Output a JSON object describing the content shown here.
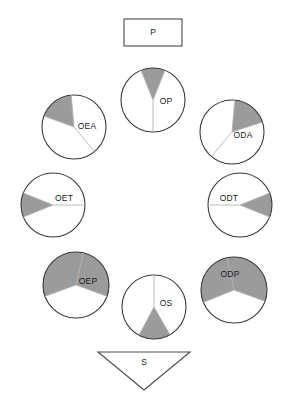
{
  "diagram": {
    "type": "ring-flow-diagram",
    "canvas": {
      "width": 287,
      "height": 406,
      "background": "#ffffff"
    },
    "colors": {
      "sector_fill": "#9b9b9b",
      "outline": "#3a3a3a",
      "divider": "#b4b4b4",
      "text": "#1a1a1a",
      "background": "#ffffff"
    },
    "top_node": {
      "label": "P",
      "shape": "rectangle",
      "x": 124,
      "y": 19,
      "width": 58,
      "height": 27
    },
    "bottom_node": {
      "label": "S",
      "shape": "triangle-down",
      "x": 98,
      "y": 352,
      "width": 92,
      "height": 38,
      "label_x": 144,
      "label_y": 363
    },
    "circles": [
      {
        "label": "OP",
        "cx": 153,
        "cy": 100,
        "r": 32,
        "fill_direction": "up",
        "fill_start_deg": 248,
        "fill_end_deg": 292,
        "divider_angles": [
          248,
          292,
          90
        ],
        "label_dx": 13,
        "label_dy": 2
      },
      {
        "label": "OEA",
        "cx": 74,
        "cy": 127,
        "r": 32,
        "fill_direction": "up-left",
        "fill_start_deg": 200,
        "fill_end_deg": 265,
        "divider_angles": [
          200,
          265,
          50
        ],
        "label_dx": 13,
        "label_dy": 0
      },
      {
        "label": "ODA",
        "cx": 232,
        "cy": 132,
        "r": 32,
        "fill_direction": "up-right",
        "fill_start_deg": 275,
        "fill_end_deg": 342,
        "divider_angles": [
          275,
          342,
          130
        ],
        "label_dx": 11,
        "label_dy": 4
      },
      {
        "label": "OET",
        "cx": 53,
        "cy": 205,
        "r": 32,
        "fill_direction": "left",
        "fill_start_deg": 158,
        "fill_end_deg": 202,
        "divider_angles": [
          158,
          202,
          0
        ],
        "label_dx": 11,
        "label_dy": -6
      },
      {
        "label": "ODT",
        "cx": 240,
        "cy": 205,
        "r": 32,
        "fill_direction": "right",
        "fill_start_deg": 338,
        "fill_end_deg": 22,
        "divider_angles": [
          338,
          22,
          180
        ],
        "label_dx": -11,
        "label_dy": -6
      },
      {
        "label": "OEP",
        "cx": 76,
        "cy": 285,
        "r": 33,
        "fill_direction": "down-left",
        "fill_start_deg": 160,
        "fill_end_deg": 20,
        "divider_angles": [
          160,
          20,
          283
        ],
        "label_dx": 12,
        "label_dy": -3
      },
      {
        "label": "OS",
        "cx": 154,
        "cy": 307,
        "r": 32,
        "fill_direction": "down",
        "fill_start_deg": 60,
        "fill_end_deg": 118,
        "divider_angles": [
          60,
          118,
          270
        ],
        "label_dx": 12,
        "label_dy": -3
      },
      {
        "label": "ODP",
        "cx": 234,
        "cy": 290,
        "r": 33,
        "fill_direction": "down-right",
        "fill_start_deg": 158,
        "fill_end_deg": 20,
        "divider_angles": [
          158,
          20,
          258
        ],
        "label_dx": -4,
        "label_dy": -15
      }
    ]
  }
}
